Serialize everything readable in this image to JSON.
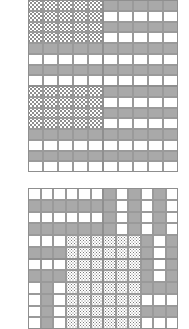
{
  "figure": {
    "title": "",
    "background_color": "#ffffff",
    "grid_line_color": "#9a9a9a",
    "fill_colors": {
      "gray": "#a9a9a9",
      "white": "#ffffff",
      "dot": "#8d8d8d"
    }
  },
  "chart_data": {
    "type": "heatmap",
    "title": "",
    "xlabel": "",
    "ylabel": "",
    "legend": [
      {
        "key": "gray",
        "label": "gray",
        "color": "#a9a9a9"
      },
      {
        "key": "white",
        "label": "white",
        "color": "#ffffff"
      },
      {
        "key": "dot",
        "label": "dotted",
        "color": "#8d8d8d"
      }
    ],
    "matrices": [
      {
        "name": "top-matrix",
        "rows": 16,
        "cols": 10,
        "block_rows": 2,
        "block_cols": 2,
        "values": [
          [
            "dot",
            "dot",
            "dot",
            "dot",
            "dot",
            "gray",
            "gray",
            "gray",
            "gray",
            "gray"
          ],
          [
            "dot",
            "dot",
            "dot",
            "dot",
            "dot",
            "white",
            "white",
            "white",
            "white",
            "white"
          ],
          [
            "dot",
            "dot",
            "dot",
            "dot",
            "dot",
            "gray",
            "gray",
            "gray",
            "gray",
            "gray"
          ],
          [
            "dot",
            "dot",
            "dot",
            "dot",
            "dot",
            "white",
            "white",
            "white",
            "white",
            "white"
          ],
          [
            "gray",
            "gray",
            "gray",
            "gray",
            "gray",
            "gray",
            "gray",
            "gray",
            "gray",
            "gray"
          ],
          [
            "white",
            "white",
            "white",
            "white",
            "white",
            "white",
            "white",
            "white",
            "white",
            "white"
          ],
          [
            "gray",
            "gray",
            "gray",
            "gray",
            "gray",
            "gray",
            "gray",
            "gray",
            "gray",
            "gray"
          ],
          [
            "white",
            "white",
            "white",
            "white",
            "white",
            "white",
            "white",
            "white",
            "white",
            "white"
          ],
          [
            "dot",
            "dot",
            "dot",
            "dot",
            "dot",
            "gray",
            "gray",
            "gray",
            "gray",
            "gray"
          ],
          [
            "dot",
            "dot",
            "dot",
            "dot",
            "dot",
            "white",
            "white",
            "white",
            "white",
            "white"
          ],
          [
            "dot",
            "dot",
            "dot",
            "dot",
            "dot",
            "gray",
            "gray",
            "gray",
            "gray",
            "gray"
          ],
          [
            "dot",
            "dot",
            "dot",
            "dot",
            "dot",
            "white",
            "white",
            "white",
            "white",
            "white"
          ],
          [
            "gray",
            "gray",
            "gray",
            "gray",
            "gray",
            "gray",
            "gray",
            "gray",
            "gray",
            "gray"
          ],
          [
            "white",
            "white",
            "white",
            "white",
            "white",
            "white",
            "white",
            "white",
            "white",
            "white"
          ],
          [
            "gray",
            "gray",
            "gray",
            "gray",
            "gray",
            "gray",
            "gray",
            "gray",
            "gray",
            "gray"
          ],
          [
            "white",
            "white",
            "white",
            "white",
            "white",
            "white",
            "white",
            "white",
            "white",
            "white"
          ]
        ]
      },
      {
        "name": "bottom-matrix",
        "rows": 12,
        "cols": 12,
        "block_rows": 2,
        "block_cols": 2,
        "values": [
          [
            "white",
            "white",
            "white",
            "white",
            "white",
            "white",
            "gray",
            "white",
            "gray",
            "white",
            "gray",
            "white"
          ],
          [
            "gray",
            "gray",
            "gray",
            "gray",
            "gray",
            "gray",
            "gray",
            "white",
            "gray",
            "white",
            "gray",
            "white"
          ],
          [
            "white",
            "white",
            "white",
            "white",
            "white",
            "white",
            "gray",
            "white",
            "gray",
            "white",
            "gray",
            "white"
          ],
          [
            "gray",
            "gray",
            "gray",
            "gray",
            "gray",
            "gray",
            "gray",
            "white",
            "gray",
            "white",
            "gray",
            "white"
          ],
          [
            "white",
            "white",
            "white",
            "dot",
            "dot",
            "dot",
            "dot",
            "dot",
            "dot",
            "gray",
            "white",
            "gray"
          ],
          [
            "gray",
            "gray",
            "gray",
            "dot",
            "dot",
            "dot",
            "dot",
            "dot",
            "dot",
            "gray",
            "white",
            "gray"
          ],
          [
            "white",
            "white",
            "white",
            "dot",
            "dot",
            "dot",
            "dot",
            "dot",
            "dot",
            "gray",
            "white",
            "gray"
          ],
          [
            "gray",
            "gray",
            "gray",
            "dot",
            "dot",
            "dot",
            "dot",
            "dot",
            "dot",
            "gray",
            "white",
            "gray"
          ],
          [
            "white",
            "gray",
            "white",
            "dot",
            "dot",
            "dot",
            "dot",
            "dot",
            "dot",
            "gray",
            "gray",
            "gray"
          ],
          [
            "white",
            "gray",
            "white",
            "dot",
            "dot",
            "dot",
            "dot",
            "dot",
            "dot",
            "white",
            "white",
            "white"
          ],
          [
            "white",
            "gray",
            "white",
            "dot",
            "dot",
            "dot",
            "dot",
            "dot",
            "dot",
            "gray",
            "gray",
            "gray"
          ],
          [
            "white",
            "gray",
            "white",
            "dot",
            "dot",
            "dot",
            "dot",
            "dot",
            "dot",
            "white",
            "white",
            "white"
          ]
        ]
      }
    ]
  }
}
